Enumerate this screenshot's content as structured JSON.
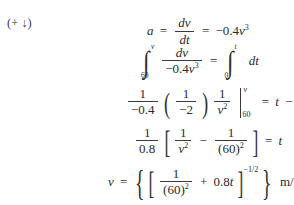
{
  "document": {
    "kind": "textbook-math-derivation",
    "background_color": "#ffffff",
    "text_color": "#2b2b2b",
    "crop_ghost": "partial cut-off line above"
  },
  "direction_tag": {
    "open": "(",
    "sign": "+",
    "arrow": "↓",
    "close": ")"
  },
  "equations": [
    {
      "id": "eq1",
      "label": "acceleration-definition",
      "lhs": "a",
      "eq1": "=",
      "frac_num": "dv",
      "frac_den": "dt",
      "eq2": "=",
      "rhs_coeff": "−0.4",
      "rhs_var": "v",
      "rhs_exp": "3"
    },
    {
      "id": "eq2",
      "label": "separated-integral",
      "int1_lower": "60",
      "int1_upper": "v",
      "frac_num": "dv",
      "frac_den_coeff": "−0.4",
      "frac_den_var": "v",
      "frac_den_exp": "3",
      "eq": "=",
      "int2_lower": "0",
      "int2_upper": "t",
      "integrand": "dt"
    },
    {
      "id": "eq3",
      "label": "evaluated-antiderivative",
      "f1_num": "1",
      "f1_den": "−0.4",
      "f2_num": "1",
      "f2_den": "−2",
      "f3_num": "1",
      "f3_den_var": "v",
      "f3_den_exp": "2",
      "eval_upper": "v",
      "eval_lower": "60",
      "eq": "=",
      "rhs_var": "t",
      "rhs_op": "−",
      "rhs_val": "0"
    },
    {
      "id": "eq4",
      "label": "simplified-bracket-form",
      "f1_num": "1",
      "f1_den": "0.8",
      "t1_num": "1",
      "t1_den_var": "v",
      "t1_den_exp": "2",
      "minus": "−",
      "t2_num": "1",
      "t2_den": "(60)",
      "t2_den_exp": "2",
      "eq": "=",
      "rhs": "t"
    },
    {
      "id": "eq5",
      "label": "velocity-solution",
      "lhs": "v",
      "eq": "=",
      "t1_num": "1",
      "t1_den": "(60)",
      "t1_den_exp": "2",
      "plus": "+",
      "t2_coeff": "0.8",
      "t2_var": "t",
      "exponent": "−1/2",
      "units": "m/s"
    }
  ]
}
